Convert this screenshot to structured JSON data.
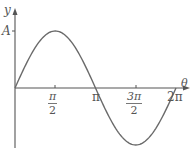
{
  "chart_data": {
    "type": "line",
    "title": "",
    "xlabel": "θ",
    "ylabel": "y",
    "series": [
      {
        "name": "y = A sin θ",
        "function": "A*sin(theta)"
      }
    ],
    "x_ticks": [
      "π/2",
      "π",
      "3π/2",
      "2π"
    ],
    "y_ticks": [
      "A"
    ],
    "x_range": [
      0,
      6.2832
    ],
    "y_range": [
      -1,
      1
    ],
    "grid": false,
    "legend": "none"
  },
  "labels": {
    "y_axis": "y",
    "x_axis": "θ",
    "amplitude": "A",
    "pi": "π",
    "half_num": "π",
    "half_den": "2",
    "three_half_num": "3π",
    "three_half_den": "2",
    "two_pi": "2π"
  },
  "colors": {
    "curve": "#6a6a6a",
    "axis": "#555555"
  }
}
